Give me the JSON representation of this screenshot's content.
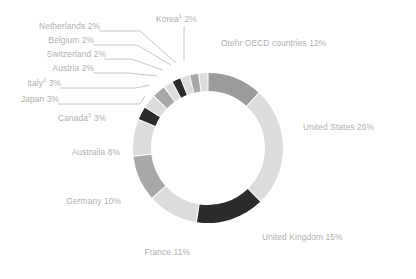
{
  "chart_data": {
    "type": "pie",
    "variant": "donut",
    "title": "",
    "subtitle": "",
    "xlabel": "",
    "ylabel": "",
    "legend_position": "none",
    "grid": false,
    "units": "percent",
    "total": 100,
    "start_angle_deg": 0,
    "direction": "clockwise",
    "categories": [
      "Otehr OECD countries",
      "United States",
      "United Kingdom",
      "France",
      "Germany",
      "Australia",
      "Canada",
      "Japan",
      "Italy",
      "Austria",
      "Switzerland",
      "Belgium",
      "Netherlands",
      "Korea"
    ],
    "values": [
      12,
      26,
      15,
      11,
      10,
      8,
      3,
      3,
      3,
      2,
      2,
      2,
      2,
      2
    ],
    "slices": [
      {
        "name": "Otehr OECD countries",
        "label": "Otehr OECD countries 12%",
        "value": 12,
        "color": "#9b9b9b",
        "footnote": ""
      },
      {
        "name": "United States",
        "label": "United States 26%",
        "value": 26,
        "color": "#dcdcdc",
        "footnote": ""
      },
      {
        "name": "United Kingdom",
        "label": "United Kingdom 15%",
        "value": 15,
        "color": "#2b2b2b",
        "footnote": ""
      },
      {
        "name": "France",
        "label": "France 11%",
        "value": 11,
        "color": "#dcdcdc",
        "footnote": ""
      },
      {
        "name": "Germany",
        "label": "Germany 10%",
        "value": 10,
        "color": "#a8a8a8",
        "footnote": ""
      },
      {
        "name": "Australia",
        "label": "Australia 8%",
        "value": 8,
        "color": "#dcdcdc",
        "footnote": ""
      },
      {
        "name": "Canada",
        "label": "Canada 3%",
        "value": 3,
        "color": "#2b2b2b",
        "footnote": "3"
      },
      {
        "name": "Japan",
        "label": "Japan 3%",
        "value": 3,
        "color": "#dcdcdc",
        "footnote": ""
      },
      {
        "name": "Italy",
        "label": "Italy 3%",
        "value": 3,
        "color": "#a8a8a8",
        "footnote": "2"
      },
      {
        "name": "Austria",
        "label": "Austria 2%",
        "value": 2,
        "color": "#dcdcdc",
        "footnote": ""
      },
      {
        "name": "Switzerland",
        "label": "Switzerland 2%",
        "value": 2,
        "color": "#2b2b2b",
        "footnote": ""
      },
      {
        "name": "Belgium",
        "label": "Belgium 2%",
        "value": 2,
        "color": "#dcdcdc",
        "footnote": ""
      },
      {
        "name": "Netherlands",
        "label": "Netherlands 2%",
        "value": 2,
        "color": "#a8a8a8",
        "footnote": ""
      },
      {
        "name": "Korea",
        "label": "Korea 2%",
        "value": 2,
        "color": "#dcdcdc",
        "footnote": "1"
      }
    ],
    "geometry": {
      "center_x": 208,
      "center_y": 148,
      "outer_radius": 75,
      "inner_radius": 57
    },
    "label_color": "#b0b0b0",
    "background": "#ffffff"
  },
  "labels": {
    "otehr_oecd": {
      "name": "Otehr OECD countries",
      "pct": "12%"
    },
    "united_states": {
      "name": "United States",
      "pct": "26%"
    },
    "united_kingdom": {
      "name": "United Kingdom",
      "pct": "15%"
    },
    "france": {
      "name": "France",
      "pct": "11%"
    },
    "germany": {
      "name": "Germany",
      "pct": "10%"
    },
    "australia": {
      "name": "Australia",
      "pct": "8%"
    },
    "canada": {
      "name": "Canada",
      "sup": "3",
      "pct": "3%"
    },
    "japan": {
      "name": "Japan",
      "pct": "3%"
    },
    "italy": {
      "name": "Italy",
      "sup": "2",
      "pct": "3%"
    },
    "austria": {
      "name": "Austria",
      "pct": "2%"
    },
    "switzerland": {
      "name": "Switzerland",
      "pct": "2%"
    },
    "belgium": {
      "name": "Belgium",
      "pct": "2%"
    },
    "netherlands": {
      "name": "Netherlands",
      "pct": "2%"
    },
    "korea": {
      "name": "Korea",
      "sup": "1",
      "pct": "2%"
    }
  }
}
